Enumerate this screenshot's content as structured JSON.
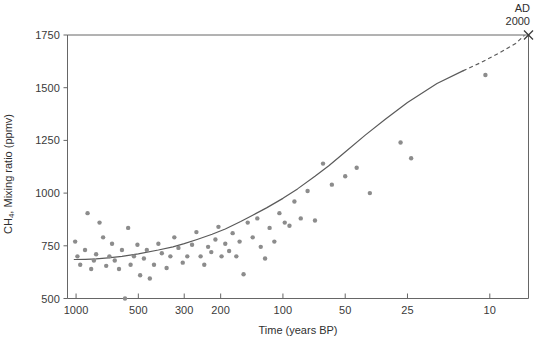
{
  "chart_data": {
    "type": "scatter",
    "title": "",
    "xlabel": "Time (years BP)",
    "ylabel": "CH4, Mixing ratio (ppmv)",
    "ylabel_prefix": "CH",
    "ylabel_sub": "4",
    "ylabel_suffix": ", Mixing ratio (ppmv)",
    "xscale": "log-reversed",
    "xlim": [
      1100,
      6.5
    ],
    "ylim": [
      500,
      1750
    ],
    "grid": false,
    "legend": null,
    "xticks": [
      1000,
      500,
      300,
      200,
      100,
      50,
      25,
      10
    ],
    "xtick_labels": [
      "1000",
      "500",
      "300",
      "200",
      "100",
      "50",
      "25",
      "10"
    ],
    "yticks": [
      500,
      750,
      1000,
      1250,
      1500,
      1750
    ],
    "ytick_labels": [
      "500",
      "750",
      "1000",
      "1250",
      "1500",
      "1750"
    ],
    "annotations": [
      {
        "text_line1": "AD",
        "text_line2": "2000",
        "x": 7.2,
        "y": 1750,
        "marker": "x"
      }
    ],
    "point_color": "#8c8c8c",
    "line_color": "#5a5a5a",
    "axis_color": "#666666",
    "series": [
      {
        "name": "Ice core CH4 measurements",
        "marker": "circle",
        "points": [
          [
            1010,
            770
          ],
          [
            985,
            700
          ],
          [
            955,
            660
          ],
          [
            905,
            730
          ],
          [
            880,
            905
          ],
          [
            845,
            640
          ],
          [
            820,
            680
          ],
          [
            800,
            710
          ],
          [
            770,
            860
          ],
          [
            740,
            790
          ],
          [
            715,
            655
          ],
          [
            690,
            700
          ],
          [
            670,
            760
          ],
          [
            650,
            680
          ],
          [
            620,
            640
          ],
          [
            600,
            730
          ],
          [
            580,
            500
          ],
          [
            560,
            835
          ],
          [
            545,
            660
          ],
          [
            525,
            700
          ],
          [
            505,
            755
          ],
          [
            490,
            610
          ],
          [
            470,
            690
          ],
          [
            455,
            730
          ],
          [
            440,
            595
          ],
          [
            420,
            660
          ],
          [
            400,
            760
          ],
          [
            385,
            715
          ],
          [
            365,
            645
          ],
          [
            350,
            700
          ],
          [
            335,
            790
          ],
          [
            320,
            740
          ],
          [
            305,
            670
          ],
          [
            290,
            700
          ],
          [
            275,
            755
          ],
          [
            262,
            815
          ],
          [
            250,
            700
          ],
          [
            240,
            660
          ],
          [
            230,
            745
          ],
          [
            222,
            720
          ],
          [
            212,
            780
          ],
          [
            205,
            840
          ],
          [
            198,
            700
          ],
          [
            190,
            760
          ],
          [
            182,
            725
          ],
          [
            175,
            810
          ],
          [
            168,
            700
          ],
          [
            162,
            770
          ],
          [
            155,
            615
          ],
          [
            148,
            860
          ],
          [
            140,
            790
          ],
          [
            133,
            880
          ],
          [
            128,
            745
          ],
          [
            122,
            690
          ],
          [
            116,
            835
          ],
          [
            110,
            770
          ],
          [
            104,
            905
          ],
          [
            98,
            860
          ],
          [
            93,
            845
          ],
          [
            88,
            960
          ],
          [
            82,
            880
          ],
          [
            76,
            1010
          ],
          [
            70,
            870
          ],
          [
            64,
            1140
          ],
          [
            58,
            1040
          ],
          [
            50,
            1080
          ],
          [
            44,
            1120
          ],
          [
            38,
            1000
          ],
          [
            27,
            1240
          ],
          [
            24,
            1165
          ],
          [
            10.5,
            1560
          ]
        ]
      }
    ],
    "trend": {
      "name": "Smoothed trend",
      "style": "solid-then-dashed",
      "solid_points": [
        [
          1020,
          685
        ],
        [
          900,
          686
        ],
        [
          800,
          688
        ],
        [
          700,
          693
        ],
        [
          600,
          700
        ],
        [
          500,
          712
        ],
        [
          400,
          730
        ],
        [
          340,
          745
        ],
        [
          300,
          760
        ],
        [
          260,
          780
        ],
        [
          220,
          805
        ],
        [
          190,
          830
        ],
        [
          160,
          865
        ],
        [
          140,
          895
        ],
        [
          120,
          930
        ],
        [
          100,
          975
        ],
        [
          85,
          1020
        ],
        [
          70,
          1080
        ],
        [
          60,
          1130
        ],
        [
          50,
          1195
        ],
        [
          40,
          1275
        ],
        [
          32,
          1350
        ],
        [
          25,
          1430
        ],
        [
          18,
          1520
        ],
        [
          13.5,
          1580
        ]
      ],
      "dashed_points": [
        [
          13.5,
          1580
        ],
        [
          11,
          1620
        ],
        [
          9,
          1665
        ],
        [
          7.5,
          1710
        ],
        [
          6.8,
          1748
        ]
      ]
    }
  }
}
